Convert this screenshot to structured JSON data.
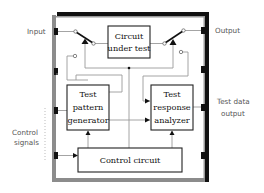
{
  "diagram": {
    "external_labels": {
      "input": "Input",
      "output": "Output",
      "control_signals": [
        "Control",
        "signals"
      ],
      "test_data_output": [
        "Test data",
        "output"
      ]
    },
    "blocks": {
      "circuit_under_test": [
        "Circuit",
        "under test"
      ],
      "test_pattern_generator": [
        "Test",
        "pattern",
        "generator"
      ],
      "test_response_analyzer": [
        "Test",
        "response",
        "analyzer"
      ],
      "control_circuit": [
        "Control circuit"
      ]
    },
    "colors": {
      "chip_border_shadow": "#111111",
      "chip_border_light": "#8c8c8c",
      "wire_gray": "#9a9a9a",
      "block_border": "#222222",
      "pin": "#111111"
    }
  }
}
